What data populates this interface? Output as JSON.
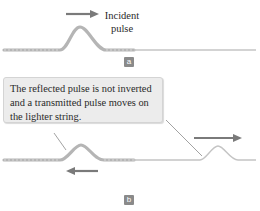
{
  "panel_a": {
    "incident_label_line1": "Incident",
    "incident_label_line2": "pulse",
    "panel_label": "a"
  },
  "panel_b": {
    "caption": "The reflected pulse is not inverted and a transmitted pulse moves on the lighter string.",
    "panel_label": "b"
  },
  "colors": {
    "string_heavy": "#b8b8b8",
    "string_light": "#c4c4c4",
    "arrow": "#7a7a7a",
    "caption_bg": "#ececec",
    "label_bg": "#8a8a8a"
  }
}
